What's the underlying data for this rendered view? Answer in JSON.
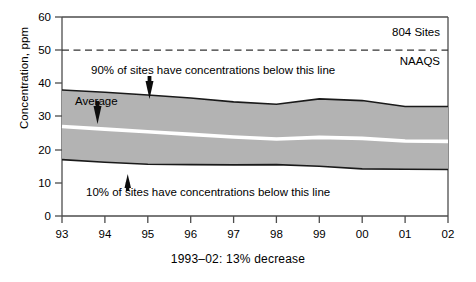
{
  "figure": {
    "caption": "1993–02: 13% decrease",
    "axis_y_title": "Concentration, ppm"
  },
  "labels": {
    "sites": "804 Sites",
    "naaqs": "NAAQS",
    "average": "Average",
    "p90_note": "90% of sites have concentrations below this line",
    "p10_note": "10% of sites have concentrations below this line"
  },
  "colors": {
    "band_fill": "#b3b3b3",
    "band_edge": "#1a1a1a",
    "average_line": "#ffffff",
    "axis": "#4d4d4d",
    "naaqs_line": "#333333",
    "background": "#ffffff"
  },
  "chart_data": {
    "type": "area",
    "title": "",
    "subtitle": "",
    "xlabel": "",
    "ylabel": "Concentration, ppm",
    "xlim": [
      1993,
      2002
    ],
    "ylim": [
      0,
      60
    ],
    "yticks": [
      0,
      10,
      20,
      30,
      40,
      50,
      60
    ],
    "xticks": [
      1993,
      1994,
      1995,
      1996,
      1997,
      1998,
      1999,
      2000,
      2001,
      2002
    ],
    "xticklabels": [
      "93",
      "94",
      "95",
      "96",
      "97",
      "98",
      "99",
      "00",
      "01",
      "02"
    ],
    "grid": false,
    "legend": "none",
    "x": [
      1993,
      1994,
      1995,
      1996,
      1997,
      1998,
      1999,
      2000,
      2001,
      2002
    ],
    "series": [
      {
        "name": "90th percentile",
        "role": "band_upper",
        "values": [
          38.0,
          37.3,
          36.5,
          35.6,
          34.4,
          33.7,
          35.3,
          34.8,
          33.0,
          33.0
        ]
      },
      {
        "name": "Average",
        "role": "mean_line",
        "values": [
          27.0,
          26.2,
          25.4,
          24.6,
          23.8,
          23.2,
          23.7,
          23.4,
          22.6,
          22.5
        ]
      },
      {
        "name": "10th percentile",
        "role": "band_lower",
        "values": [
          17.0,
          16.2,
          15.6,
          15.5,
          15.4,
          15.5,
          15.0,
          14.2,
          14.1,
          14.0
        ]
      }
    ],
    "reference_lines": [
      {
        "name": "NAAQS",
        "value": 50,
        "style": "dashed",
        "label": "NAAQS"
      }
    ],
    "annotations": [
      {
        "text": "804 Sites",
        "x": 2000.6,
        "y": 55.0
      },
      {
        "text": "NAAQS",
        "x": 2000.9,
        "y": 47.0
      },
      {
        "text": "90% of sites have concentrations below this line",
        "x": 1994.0,
        "y": 44.0
      },
      {
        "text": "10% of sites have concentrations below this line",
        "x": 1994.0,
        "y": 7.5
      },
      {
        "text": "Average",
        "x": 1994.0,
        "y": 31.0
      }
    ],
    "trend_note": "1993–02: 13% decrease"
  }
}
